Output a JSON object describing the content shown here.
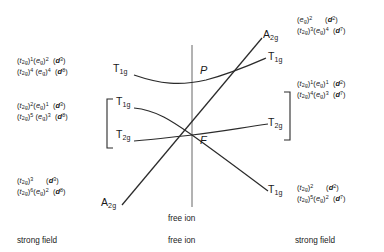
{
  "diagram": {
    "title_center_axis": "free ion",
    "free_ion_terms": [
      {
        "id": "P",
        "label": "P"
      },
      {
        "id": "F",
        "label": "F"
      }
    ],
    "bottom_labels": [
      {
        "id": "left",
        "label": "strong field"
      },
      {
        "id": "center",
        "label": "free ion"
      },
      {
        "id": "right",
        "label": "strong field"
      }
    ],
    "term_labels_left": [
      {
        "id": "t1g-p",
        "label": "T",
        "sub": "1g"
      },
      {
        "id": "t1g-f",
        "label": "T",
        "sub": "1g"
      },
      {
        "id": "t2g-f",
        "label": "T",
        "sub": "2g"
      },
      {
        "id": "a2g-f",
        "label": "A",
        "sub": "2g"
      }
    ],
    "term_labels_right": [
      {
        "id": "a2g-up",
        "label": "A",
        "sub": "2g"
      },
      {
        "id": "t1g-up",
        "label": "T",
        "sub": "1g"
      },
      {
        "id": "t2g-mid",
        "label": "T",
        "sub": "2g"
      },
      {
        "id": "t1g-down",
        "label": "T",
        "sub": "1g"
      }
    ],
    "configurations_left": [
      {
        "id": "left-group-1",
        "lines": [
          {
            "t2g_exp": "1",
            "eg_exp": "2",
            "d_term": "3"
          },
          {
            "t2g_exp": "4",
            "eg_exp": "4",
            "d_term": "8"
          }
        ]
      },
      {
        "id": "left-group-2",
        "lines": [
          {
            "t2g_exp": "2",
            "eg_exp": "1",
            "d_term": "3"
          },
          {
            "t2g_exp": "5",
            "eg_exp": "3",
            "d_term": "8"
          }
        ]
      },
      {
        "id": "left-group-3",
        "lines": [
          {
            "t2g_exp": "3",
            "eg_exp": "",
            "d_term": "3"
          },
          {
            "t2g_exp": "6",
            "eg_exp": "2",
            "d_term": "8"
          }
        ]
      }
    ],
    "configurations_right": [
      {
        "id": "right-group-1",
        "lines": [
          {
            "t2g_exp": "",
            "eg_exp": "2",
            "d_term": "2"
          },
          {
            "t2g_exp": "3",
            "eg_exp": "4",
            "d_term": "7"
          }
        ]
      },
      {
        "id": "right-group-2",
        "lines": [
          {
            "t2g_exp": "1",
            "eg_exp": "1",
            "d_term": "2"
          },
          {
            "t2g_exp": "4",
            "eg_exp": "3",
            "d_term": "7"
          }
        ]
      },
      {
        "id": "right-group-3",
        "lines": [
          {
            "t2g_exp": "2",
            "eg_exp": "",
            "d_term": "2"
          },
          {
            "t2g_exp": "5",
            "eg_exp": "2",
            "d_term": "7"
          }
        ]
      }
    ],
    "symbols": {
      "t2g": "t",
      "t2g_sub": "2g",
      "eg": "e",
      "eg_sub": "g",
      "d": "d",
      "open_paren": "(",
      "close_paren": ")"
    },
    "colors": {
      "line": "#2b2b2b",
      "text": "#1a1a1a",
      "background": "#ffffff"
    }
  }
}
